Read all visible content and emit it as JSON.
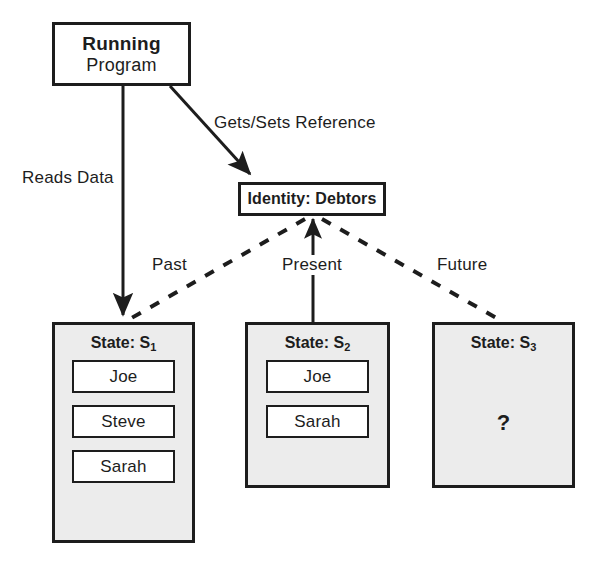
{
  "diagram": {
    "colors": {
      "stroke": "#1d1d1d",
      "state_fill": "#ececec",
      "box_fill": "#ffffff",
      "background": "#ffffff"
    },
    "program_node": {
      "line1": "Running",
      "line2": "Program"
    },
    "identity_node": {
      "label": "Identity: Debtors"
    },
    "edge_labels": {
      "reads_data": "Reads Data",
      "gets_sets_reference": "Gets/Sets Reference",
      "past": "Past",
      "present": "Present",
      "future": "Future"
    },
    "states": [
      {
        "title_prefix": "State: S",
        "subscript": "1",
        "items": [
          "Joe",
          "Steve",
          "Sarah"
        ],
        "placeholder": ""
      },
      {
        "title_prefix": "State: S",
        "subscript": "2",
        "items": [
          "Joe",
          "Sarah"
        ],
        "placeholder": ""
      },
      {
        "title_prefix": "State: S",
        "subscript": "3",
        "items": [],
        "placeholder": "?"
      }
    ],
    "edges": [
      {
        "name": "reads-data-arrow",
        "from": "running-program",
        "to": "state-s1",
        "style": "solid",
        "arrow": true
      },
      {
        "name": "gets-sets-reference-arrow",
        "from": "running-program",
        "to": "identity-debtors",
        "style": "solid",
        "arrow": true
      },
      {
        "name": "past-link",
        "from": "identity-debtors",
        "to": "state-s1",
        "style": "dashed",
        "arrow": false
      },
      {
        "name": "present-link",
        "from": "identity-debtors",
        "to": "state-s2",
        "style": "solid",
        "arrow": true
      },
      {
        "name": "future-link",
        "from": "identity-debtors",
        "to": "state-s3",
        "style": "dashed",
        "arrow": false
      }
    ]
  }
}
